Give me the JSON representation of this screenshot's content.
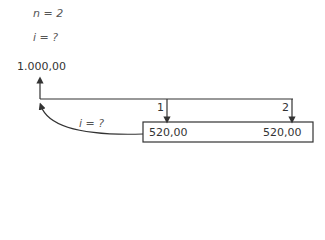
{
  "givens": {
    "n": "n = 2",
    "i": "i = ?"
  },
  "diagram": {
    "present_value": "1.000,00",
    "rate_label": "i = ?",
    "periods": [
      {
        "label": "1",
        "payment": "520,00"
      },
      {
        "label": "2",
        "payment": "520,00"
      }
    ],
    "line_color": "#333333"
  }
}
